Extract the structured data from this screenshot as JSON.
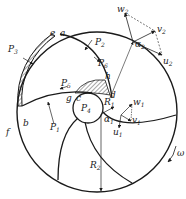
{
  "figure": {
    "rotation_label": "ω",
    "points": [
      "a",
      "b",
      "c",
      "d",
      "e",
      "f",
      "g",
      "h"
    ],
    "pressure_labels": [
      "P1",
      "P2",
      "P3",
      "P4",
      "P5",
      "P6"
    ],
    "radius_labels": [
      "R1",
      "R2"
    ],
    "outlet_triangle": {
      "w": "w2",
      "v": "v2",
      "u": "u2",
      "angle": "α2"
    },
    "inlet_triangle": {
      "w": "w1",
      "v": "v1",
      "u": "u1",
      "angle": "α1"
    }
  },
  "labels": {
    "a": "a",
    "b": "b",
    "c": "c",
    "d": "d",
    "e": "e",
    "f": "f",
    "g": "g",
    "h": "h",
    "P1": "P",
    "P1s": "1",
    "P2": "P",
    "P2s": "2",
    "P3": "P",
    "P3s": "3",
    "P4": "P",
    "P4s": "4",
    "P5": "P",
    "P5s": "5",
    "P6": "P",
    "P6s": "6",
    "R1": "R",
    "R1s": "1",
    "R2": "R",
    "R2s": "2",
    "w2": "w",
    "w2s": "2",
    "v2": "v",
    "v2s": "2",
    "u2": "u",
    "u2s": "2",
    "a2": "α",
    "a2s": "2",
    "w1": "w",
    "w1s": "1",
    "v1": "v",
    "v1s": "1",
    "u1": "u",
    "u1s": "1",
    "a1": "α",
    "a1s": "1",
    "omega": "ω"
  }
}
